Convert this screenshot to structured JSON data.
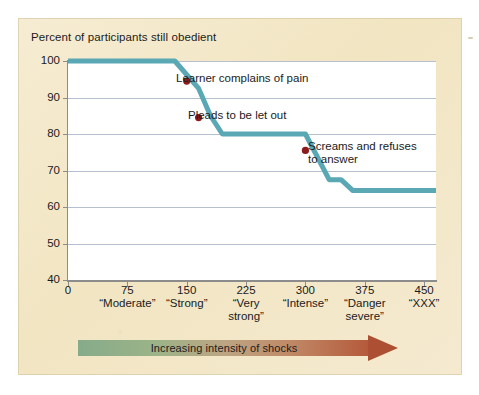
{
  "figure": {
    "panel_bg": "#f3e8c8",
    "plot_bg": "#ffffff",
    "line_color": "#5ba8b5",
    "dot_color": "#8c1b1b",
    "grid_color": "#a9b4c6",
    "axis_color": "#8c8c8c"
  },
  "arrow": {
    "label": "Increasing intensity of shocks",
    "start_color": "#86ab8a",
    "end_color": "#b5593a"
  },
  "chart_data": {
    "type": "line",
    "title": "Percent of participants still obedient",
    "xlabel": "",
    "ylabel": "Percent of participants still obedient",
    "xlim": [
      0,
      465
    ],
    "ylim": [
      40,
      100
    ],
    "grid": true,
    "legend": "none",
    "yticks": [
      40,
      50,
      60,
      70,
      80,
      90,
      100
    ],
    "ytick_labels": [
      "40",
      "50",
      "60",
      "70",
      "80",
      "90",
      "100"
    ],
    "xticks": [
      0,
      75,
      150,
      225,
      300,
      375,
      450
    ],
    "xtick_labels": [
      "0",
      "75",
      "150",
      "225",
      "300",
      "375",
      "450"
    ],
    "xtick_names": [
      "",
      "“Moderate”",
      "“Strong”",
      "“Very\nstrong”",
      "“Intense”",
      "“Danger\nsevere”",
      "“XXX”"
    ],
    "series": [
      {
        "name": "Percent still obedient",
        "x": [
          0,
          120,
          135,
          165,
          180,
          195,
          300,
          330,
          345,
          360,
          465
        ],
        "values": [
          100,
          100,
          100,
          92.5,
          85,
          80,
          80,
          67.5,
          67.5,
          64.5,
          64.5
        ]
      }
    ],
    "points": [
      {
        "x": 150,
        "y": 94.5,
        "label": "Learner complains of pain"
      },
      {
        "x": 165,
        "y": 84.5,
        "label": "Pleads to be let out"
      },
      {
        "x": 300,
        "y": 75.5,
        "label": "Screams and refuses\nto answer"
      }
    ],
    "annotations": [
      {
        "text": "Learner complains of pain",
        "left": 176,
        "top": 72
      },
      {
        "text": "Pleads to be let out",
        "left": 188,
        "top": 109
      },
      {
        "text": "Screams and refuses\nto answer",
        "left": 308,
        "top": 140
      }
    ]
  }
}
